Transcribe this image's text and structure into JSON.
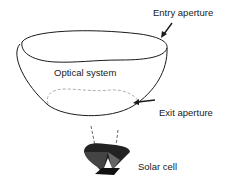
{
  "diagram": {
    "labels": {
      "entry_aperture": "Entry aperture",
      "optical_system": "Optical system",
      "exit_aperture": "Exit aperture",
      "solar_cell": "Solar cell"
    },
    "colors": {
      "stroke": "#1a1a1a",
      "dashed": "#999999",
      "cell_dark": "#111111",
      "cell_mid": "#555555"
    }
  }
}
